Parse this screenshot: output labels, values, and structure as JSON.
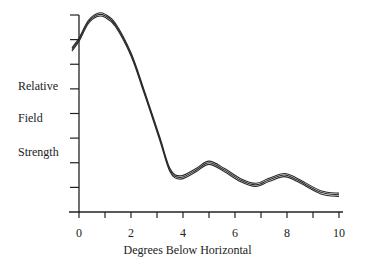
{
  "chart_data": {
    "type": "line",
    "title": "",
    "xlabel": "Degrees Below Horizontal",
    "ylabel": "Relative Field Strength",
    "ylabel_lines": [
      "Relative",
      "Field",
      "Strength"
    ],
    "xlim": [
      0,
      10
    ],
    "ylim": [
      0,
      8
    ],
    "x_ticks": [
      0,
      1,
      2,
      3,
      4,
      5,
      6,
      7,
      8,
      9,
      10
    ],
    "x_tick_labels": [
      "0",
      "",
      "2",
      "",
      "4",
      "",
      "6",
      "",
      "8",
      "",
      "10"
    ],
    "y_ticks": [
      0,
      1,
      2,
      3,
      4,
      5,
      6,
      7,
      8
    ],
    "y_tick_labels": [],
    "grid": false,
    "legend": null,
    "series": [
      {
        "name": "Relative Field Strength",
        "x": [
          -0.27,
          0.0,
          0.35,
          0.7,
          1.0,
          1.4,
          2.0,
          2.5,
          3.1,
          3.5,
          3.9,
          4.5,
          5.0,
          5.6,
          6.2,
          6.8,
          7.3,
          7.9,
          8.4,
          9.3,
          10.0
        ],
        "y": [
          6.6,
          7.0,
          7.7,
          8.0,
          7.97,
          7.6,
          6.4,
          4.9,
          3.0,
          1.7,
          1.4,
          1.7,
          2.0,
          1.7,
          1.3,
          1.1,
          1.3,
          1.5,
          1.3,
          0.8,
          0.7
        ]
      }
    ]
  },
  "labels": {
    "y_line1": "Relative",
    "y_line2": "Field",
    "y_line3": "Strength",
    "x_axis": "Degrees Below Horizontal"
  }
}
